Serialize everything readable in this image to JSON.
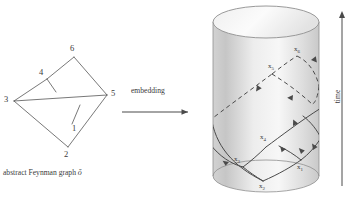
{
  "figure": {
    "left_panel": {
      "caption_prefix": "abstract Feynman graph ",
      "caption_symbol": "ǒ",
      "vertices": [
        {
          "id": "v6",
          "label": "6",
          "x": 70,
          "y": 47
        },
        {
          "id": "v4",
          "label": "4",
          "x": 40,
          "y": 73
        },
        {
          "id": "v5",
          "label": "5",
          "x": 112,
          "y": 92
        },
        {
          "id": "v3",
          "label": "3",
          "x": 6,
          "y": 95
        },
        {
          "id": "v1",
          "label": "1",
          "x": 74,
          "y": 127
        },
        {
          "id": "v2",
          "label": "2",
          "x": 62,
          "y": 153
        }
      ],
      "edges": [
        {
          "from": "3",
          "to": "4"
        },
        {
          "from": "4",
          "to": "6"
        },
        {
          "from": "6",
          "to": "5"
        },
        {
          "from": "3",
          "to": "5"
        },
        {
          "from": "3",
          "to": "2"
        },
        {
          "from": "2",
          "to": "1"
        },
        {
          "from": "1",
          "to": "5"
        },
        {
          "from": "4",
          "to": "1"
        }
      ],
      "edge_color": "#555555"
    },
    "middle_panel": {
      "arrow_label": "embedding"
    },
    "right_panel": {
      "time_axis_label": "time",
      "cylinder": {
        "fill_light": "#f4f4f4",
        "fill_mid": "#d9d9d9",
        "fill_dark": "#bdbdbd",
        "outline": "#8a8a8a"
      },
      "worldline_color": "#4a4a4a",
      "points": [
        {
          "id": "x1",
          "label": "x",
          "sub": "1",
          "x": 281,
          "y": 169
        },
        {
          "id": "x2",
          "label": "x",
          "sub": "2",
          "x": 262,
          "y": 185
        },
        {
          "id": "x3",
          "label": "x",
          "sub": "3",
          "x": 238,
          "y": 156
        },
        {
          "id": "x4",
          "label": "x",
          "sub": "4",
          "x": 262,
          "y": 137
        },
        {
          "id": "x5",
          "label": "x",
          "sub": "5",
          "x": 272,
          "y": 66
        },
        {
          "id": "x6",
          "label": "x",
          "sub": "6",
          "x": 296,
          "y": 50
        }
      ]
    }
  }
}
